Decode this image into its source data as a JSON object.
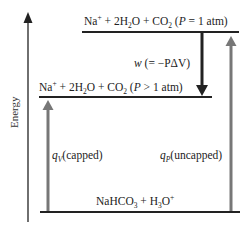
{
  "diagram": {
    "type": "energy-level-diagram",
    "axis": {
      "label": "Energy"
    },
    "levels": {
      "top": {
        "species": "Na+ + 2H2O + CO2",
        "condition_var": "P",
        "condition_rel": "= 1 atm"
      },
      "middle": {
        "species": "Na+ + 2H2O + CO2",
        "condition_var": "P",
        "condition_rel": "> 1 atm"
      },
      "bottom": {
        "species": "NaHCO3 + H3O+"
      }
    },
    "arrows": {
      "work": {
        "label_var": "w",
        "label_expr": "(= −PΔV)",
        "direction": "down",
        "color": "#222222"
      },
      "qv": {
        "label_var": "q",
        "label_sub": "V",
        "label_text": "(capped)",
        "direction": "up",
        "color": "#777777"
      },
      "qp": {
        "label_var": "q",
        "label_sub": "P",
        "label_text": "(uncapped)",
        "direction": "up",
        "color": "#777777"
      }
    }
  }
}
